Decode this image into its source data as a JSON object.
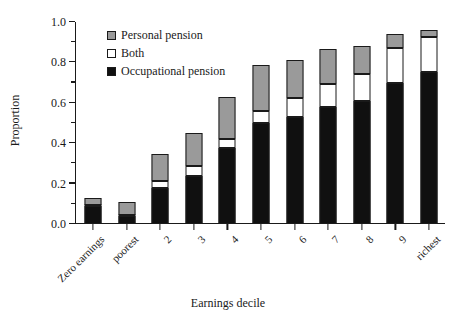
{
  "chart_data": {
    "type": "bar",
    "stacked": true,
    "title": "",
    "xlabel": "Earnings decile",
    "ylabel": "Proportion",
    "ylim": [
      0.0,
      1.0
    ],
    "ytick_labels": [
      "0.0",
      "0.2",
      "0.4",
      "0.6",
      "0.8",
      "1.0"
    ],
    "ytick_values": [
      0.0,
      0.2,
      0.4,
      0.6,
      0.8,
      1.0
    ],
    "yminor_values": [
      0.1,
      0.3,
      0.5,
      0.7,
      0.9
    ],
    "grid": false,
    "legend_position": "top-left",
    "categories": [
      "Zero earnings",
      "poorest",
      "2",
      "3",
      "4",
      "5",
      "6",
      "7",
      "8",
      "9",
      "richest"
    ],
    "series": [
      {
        "name": "Occupational pension",
        "color": "#101010",
        "values": [
          0.09,
          0.04,
          0.18,
          0.24,
          0.375,
          0.5,
          0.53,
          0.58,
          0.61,
          0.7,
          0.755
        ]
      },
      {
        "name": "Both",
        "color": "#ffffff",
        "values": [
          0.005,
          0.005,
          0.035,
          0.045,
          0.045,
          0.06,
          0.095,
          0.115,
          0.135,
          0.17,
          0.17
        ]
      },
      {
        "name": "Personal pension",
        "color": "#9a9a9a",
        "values": [
          0.035,
          0.065,
          0.13,
          0.165,
          0.21,
          0.225,
          0.185,
          0.17,
          0.135,
          0.07,
          0.035
        ]
      }
    ],
    "totals": [
      0.13,
      0.11,
      0.345,
      0.45,
      0.63,
      0.785,
      0.81,
      0.865,
      0.88,
      0.94,
      0.96
    ]
  },
  "legend": {
    "items": [
      {
        "label": "Personal pension",
        "swatch": "pers"
      },
      {
        "label": "Both",
        "swatch": "both"
      },
      {
        "label": "Occupational pension",
        "swatch": "occ"
      }
    ]
  }
}
